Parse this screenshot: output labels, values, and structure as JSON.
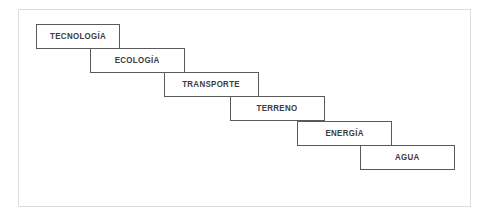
{
  "diagram": {
    "frame": {
      "x": 18,
      "y": 9,
      "width": 453,
      "height": 198,
      "border_color": "#dcdcdc",
      "background": "#ffffff"
    },
    "style": {
      "box_border_color": "#5a5a5a",
      "box_background": "#ffffff",
      "label_color": "#3c3c3c",
      "box_width": 95,
      "box_height": 25,
      "step_dx": 66,
      "step_dy": 24
    },
    "steps": [
      {
        "label": "TECNOLOGÍA",
        "x": 36,
        "y": 24,
        "width": 84,
        "height": 25
      },
      {
        "label": "ECOLOGÍA",
        "x": 90,
        "y": 48,
        "width": 95,
        "height": 25
      },
      {
        "label": "TRANSPORTE",
        "x": 164,
        "y": 72,
        "width": 95,
        "height": 25
      },
      {
        "label": "TERRENO",
        "x": 230,
        "y": 96,
        "width": 95,
        "height": 25
      },
      {
        "label": "ENERGÍA",
        "x": 297,
        "y": 121,
        "width": 95,
        "height": 25
      },
      {
        "label": "AGUA",
        "x": 360,
        "y": 145,
        "width": 95,
        "height": 25
      }
    ]
  }
}
